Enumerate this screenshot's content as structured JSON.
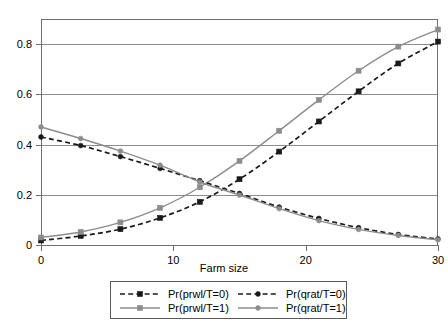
{
  "chart_data": {
    "type": "line",
    "title": "",
    "subtitle": "",
    "xlabel": "Farm size",
    "ylabel": "",
    "xlim": [
      0,
      30
    ],
    "ylim": [
      0,
      0.9
    ],
    "x_ticks": [
      "0",
      "10",
      "20",
      "30"
    ],
    "x_tick_values": [
      0,
      10,
      20,
      30
    ],
    "y_ticks": [
      "0",
      "0.2",
      "0.4",
      "0.6",
      "0.8"
    ],
    "y_tick_values": [
      0,
      0.2,
      0.4,
      0.6,
      0.8
    ],
    "grid": "horizontal",
    "legend_position": "below-center",
    "x": [
      0,
      3,
      6,
      9,
      12,
      15,
      18,
      21,
      24,
      27,
      30
    ],
    "series": [
      {
        "name": "Pr(prwl/T=0)",
        "color": "#1a1a1a",
        "linestyle": "dashed",
        "marker": "square",
        "values": [
          0.018,
          0.036,
          0.063,
          0.108,
          0.172,
          0.262,
          0.372,
          0.492,
          0.612,
          0.723,
          0.81
        ]
      },
      {
        "name": "Pr(prwl/T=1)",
        "color": "#8c8c8c",
        "linestyle": "solid",
        "marker": "square",
        "values": [
          0.03,
          0.052,
          0.09,
          0.148,
          0.23,
          0.335,
          0.455,
          0.578,
          0.694,
          0.79,
          0.858
        ]
      },
      {
        "name": "Pr(qrat/T=0)",
        "color": "#1a1a1a",
        "linestyle": "dashed",
        "marker": "circle",
        "values": [
          0.43,
          0.396,
          0.352,
          0.305,
          0.256,
          0.205,
          0.151,
          0.106,
          0.069,
          0.042,
          0.024
        ]
      },
      {
        "name": "Pr(qrat/T=1)",
        "color": "#8c8c8c",
        "linestyle": "solid",
        "marker": "circle",
        "values": [
          0.47,
          0.424,
          0.374,
          0.318,
          0.251,
          0.199,
          0.145,
          0.097,
          0.062,
          0.038,
          0.021
        ]
      }
    ],
    "legend_entries": [
      {
        "label": "Pr(prwl/T=0)",
        "color": "#1a1a1a",
        "linestyle": "dashed",
        "marker": "square"
      },
      {
        "label": "Pr(qrat/T=0)",
        "color": "#1a1a1a",
        "linestyle": "dashed",
        "marker": "circle"
      },
      {
        "label": "Pr(prwl/T=1)",
        "color": "#8c8c8c",
        "linestyle": "solid",
        "marker": "square"
      },
      {
        "label": "Pr(qrat/T=1)",
        "color": "#8c8c8c",
        "linestyle": "solid",
        "marker": "circle"
      }
    ]
  }
}
